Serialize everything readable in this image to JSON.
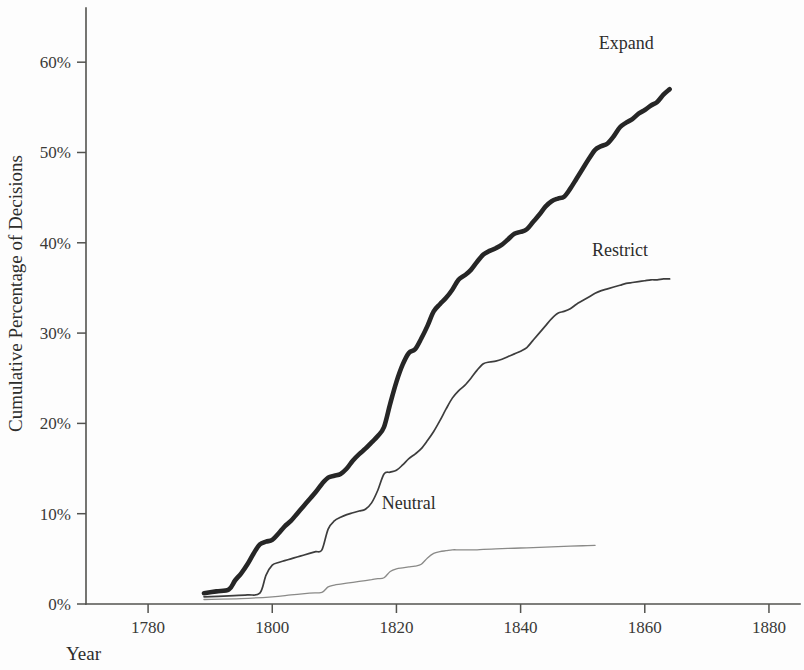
{
  "figure": {
    "background": "#fdfdfd",
    "ink": "#2e2e2c"
  },
  "axis": {
    "y_title": "Cumulative Percentage of Decisions",
    "x_title": "Year",
    "y_ticks": [
      "0%",
      "10%",
      "20%",
      "30%",
      "40%",
      "50%",
      "60%"
    ],
    "x_ticks": [
      "1780",
      "1800",
      "1820",
      "1840",
      "1860",
      "1880"
    ]
  },
  "labels": {
    "expand": "Expand",
    "restrict": "Restrict",
    "neutral": "Neutral"
  },
  "chart_data": {
    "type": "line",
    "title": "",
    "subtitle": "",
    "xlabel": "Year",
    "ylabel": "Cumulative Percentage of Decisions",
    "xlim": [
      1770,
      1885
    ],
    "ylim": [
      0,
      66
    ],
    "xticks": [
      1780,
      1800,
      1820,
      1840,
      1860,
      1880
    ],
    "xticklabels": [
      "1780",
      "1800",
      "1820",
      "1840",
      "1860",
      "1880"
    ],
    "yticks": [
      0,
      10,
      20,
      30,
      40,
      50,
      60
    ],
    "yticklabels": [
      "0%",
      "10%",
      "20%",
      "30%",
      "40%",
      "50%",
      "60%"
    ],
    "grid": false,
    "legend": "inline-end-of-line",
    "annotations": [
      {
        "text": "Expand",
        "x": 1857,
        "y": 61.5
      },
      {
        "text": "Restrict",
        "x": 1856,
        "y": 38.5
      },
      {
        "text": "Neutral",
        "x": 1822,
        "y": 10.5
      }
    ],
    "series": [
      {
        "name": "Expand",
        "color": "#262626",
        "width": 4.6,
        "x": [
          1789,
          1791,
          1793,
          1794,
          1795,
          1796,
          1797,
          1798,
          1799,
          1800,
          1801,
          1802,
          1803,
          1804,
          1805,
          1806,
          1807,
          1808,
          1809,
          1810,
          1811,
          1812,
          1813,
          1814,
          1815,
          1816,
          1817,
          1818,
          1819,
          1820,
          1821,
          1822,
          1823,
          1824,
          1825,
          1826,
          1827,
          1828,
          1829,
          1830,
          1831,
          1832,
          1833,
          1834,
          1835,
          1836,
          1837,
          1838,
          1839,
          1840,
          1841,
          1842,
          1843,
          1844,
          1845,
          1846,
          1847,
          1848,
          1849,
          1850,
          1851,
          1852,
          1853,
          1854,
          1855,
          1856,
          1857,
          1858,
          1859,
          1860,
          1861,
          1862,
          1863,
          1864
        ],
        "y": [
          1.2,
          1.4,
          1.6,
          2.6,
          3.4,
          4.4,
          5.6,
          6.6,
          6.9,
          7.1,
          7.8,
          8.6,
          9.2,
          10.0,
          10.8,
          11.6,
          12.4,
          13.3,
          14.0,
          14.2,
          14.4,
          15.0,
          15.9,
          16.6,
          17.2,
          17.9,
          18.6,
          19.6,
          22.2,
          24.6,
          26.5,
          27.8,
          28.2,
          29.4,
          30.8,
          32.4,
          33.2,
          33.9,
          34.8,
          35.9,
          36.4,
          37.0,
          37.9,
          38.7,
          39.1,
          39.4,
          39.8,
          40.4,
          41.0,
          41.2,
          41.5,
          42.3,
          43.1,
          44.0,
          44.6,
          44.9,
          45.1,
          46.0,
          47.1,
          48.2,
          49.3,
          50.3,
          50.7,
          51.0,
          51.8,
          52.8,
          53.3,
          53.7,
          54.3,
          54.7,
          55.2,
          55.6,
          56.4,
          57.0
        ]
      },
      {
        "name": "Restrict",
        "color": "#3d3d3d",
        "width": 1.7,
        "x": [
          1789,
          1793,
          1796,
          1798,
          1799,
          1800,
          1801,
          1802,
          1803,
          1804,
          1805,
          1806,
          1807,
          1808,
          1809,
          1810,
          1811,
          1812,
          1813,
          1814,
          1815,
          1816,
          1817,
          1818,
          1819,
          1820,
          1821,
          1822,
          1823,
          1824,
          1825,
          1826,
          1827,
          1828,
          1829,
          1830,
          1831,
          1832,
          1833,
          1834,
          1835,
          1836,
          1837,
          1838,
          1839,
          1840,
          1841,
          1842,
          1843,
          1844,
          1845,
          1846,
          1847,
          1848,
          1849,
          1850,
          1851,
          1852,
          1853,
          1854,
          1855,
          1856,
          1857,
          1858,
          1859,
          1860,
          1861,
          1862,
          1863,
          1864
        ],
        "y": [
          0.8,
          0.9,
          1.0,
          1.2,
          3.2,
          4.3,
          4.6,
          4.8,
          5.0,
          5.2,
          5.4,
          5.6,
          5.8,
          6.0,
          8.3,
          9.2,
          9.6,
          9.9,
          10.1,
          10.3,
          10.5,
          11.2,
          12.6,
          14.4,
          14.6,
          14.8,
          15.4,
          16.1,
          16.6,
          17.2,
          18.1,
          19.1,
          20.3,
          21.6,
          22.8,
          23.6,
          24.2,
          25.0,
          25.9,
          26.6,
          26.8,
          26.9,
          27.1,
          27.4,
          27.7,
          28.0,
          28.4,
          29.2,
          30.0,
          30.8,
          31.6,
          32.2,
          32.4,
          32.7,
          33.2,
          33.6,
          34.0,
          34.4,
          34.7,
          34.9,
          35.1,
          35.3,
          35.5,
          35.6,
          35.7,
          35.8,
          35.9,
          35.9,
          36.0,
          36.0
        ]
      },
      {
        "name": "Neutral",
        "color": "#8a8a88",
        "width": 1.3,
        "x": [
          1789,
          1795,
          1800,
          1803,
          1806,
          1808,
          1809,
          1810,
          1811,
          1812,
          1813,
          1814,
          1815,
          1816,
          1817,
          1818,
          1819,
          1820,
          1821,
          1822,
          1823,
          1824,
          1825,
          1826,
          1827,
          1828,
          1829,
          1830,
          1831,
          1832,
          1833,
          1834,
          1836,
          1838,
          1840,
          1842,
          1844,
          1846,
          1848,
          1850,
          1852
        ],
        "y": [
          0.5,
          0.6,
          0.8,
          1.0,
          1.2,
          1.3,
          1.9,
          2.1,
          2.2,
          2.3,
          2.4,
          2.5,
          2.6,
          2.7,
          2.8,
          2.9,
          3.6,
          3.9,
          4.0,
          4.1,
          4.2,
          4.4,
          5.1,
          5.6,
          5.8,
          5.9,
          6.0,
          6.0,
          6.0,
          6.0,
          6.0,
          6.05,
          6.1,
          6.15,
          6.2,
          6.25,
          6.3,
          6.35,
          6.4,
          6.45,
          6.5
        ]
      }
    ]
  },
  "geometry": {
    "plot_left": 86,
    "plot_right": 800,
    "plot_top": 8,
    "plot_bottom": 604,
    "x_min": 1770,
    "x_max": 1885,
    "y_min": 0,
    "y_max": 66
  }
}
